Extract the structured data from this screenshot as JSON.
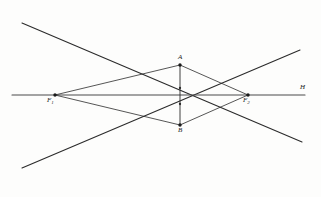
{
  "figure": {
    "background_color": "#fdfdfc",
    "stroke_color": "#2b2b2b",
    "labels": {
      "axis_end": "H",
      "left_focus": "F",
      "left_focus_sub": "1",
      "right_focus": "F",
      "right_focus_sub": "2",
      "top_point": "A",
      "bottom_point": "B"
    }
  },
  "chart_data": {
    "type": "scatter",
    "xlabel": "",
    "ylabel": "",
    "xlim": [
      0,
      321
    ],
    "ylim": [
      0,
      197
    ],
    "grid": false,
    "legend": null,
    "points": [
      {
        "name": "F1",
        "label": "F1",
        "x": 55,
        "y": 95
      },
      {
        "name": "F2",
        "label": "F2",
        "x": 248,
        "y": 95
      },
      {
        "name": "A",
        "label": "A",
        "x": 180,
        "y": 65
      },
      {
        "name": "B",
        "label": "B",
        "x": 180,
        "y": 125
      }
    ],
    "tick_marks": [
      {
        "on": "AB",
        "x": 180,
        "y": 88
      },
      {
        "on": "AB",
        "x": 180,
        "y": 104
      }
    ],
    "segments": [
      {
        "name": "principal-axis",
        "x1": 12,
        "y1": 95,
        "x2": 305,
        "y2": 95,
        "width": 1.1
      },
      {
        "name": "vertical-axis-AB",
        "x1": 180,
        "y1": 65,
        "x2": 180,
        "y2": 125,
        "width": 0.9
      },
      {
        "name": "chord-F1-A",
        "x1": 55,
        "y1": 95,
        "x2": 180,
        "y2": 65,
        "width": 0.8
      },
      {
        "name": "chord-A-F2",
        "x1": 180,
        "y1": 65,
        "x2": 248,
        "y2": 95,
        "width": 0.8
      },
      {
        "name": "chord-F2-B",
        "x1": 248,
        "y1": 95,
        "x2": 180,
        "y2": 125,
        "width": 0.8
      },
      {
        "name": "chord-B-F1",
        "x1": 180,
        "y1": 125,
        "x2": 55,
        "y2": 95,
        "width": 0.8
      },
      {
        "name": "asymptote-upper-left",
        "x1": 22,
        "y1": 23,
        "x2": 302,
        "y2": 142,
        "width": 1.1
      },
      {
        "name": "asymptote-lower-left",
        "x1": 22,
        "y1": 168,
        "x2": 300,
        "y2": 50,
        "width": 1.1
      }
    ]
  }
}
